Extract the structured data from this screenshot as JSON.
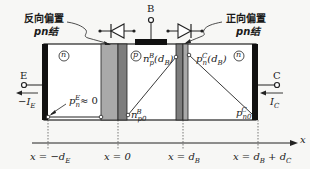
{
  "annotations": {
    "left_junction": {
      "line1": "反向偏置",
      "line2": "pn结"
    },
    "right_junction": {
      "line1": "正向偏置",
      "line2": "pn结"
    }
  },
  "terminals": {
    "base": "B",
    "emitter": "E",
    "collector": "C",
    "emitter_current": "−I",
    "emitter_current_sub": "E",
    "collector_current": "I",
    "collector_current_sub": "C"
  },
  "regions": {
    "emitter": "n",
    "base": "p",
    "collector": "n"
  },
  "carrier_labels": {
    "pE_main": "p",
    "pE_sub": "n",
    "pE_sup": "E",
    "pE_value": "≈ 0",
    "npB_main": "n",
    "npB_sub": "p",
    "npB_sup": "B",
    "npB_arg": "(d",
    "npB_arg_sub": "B",
    "npB_close": ")",
    "pnC_main": "p",
    "pnC_sub": "n",
    "pnC_sup": "C",
    "pnC_arg": "(d",
    "pnC_arg_sub": "B",
    "pnC_close": ")",
    "np0_main": "n",
    "np0_sub": "p0",
    "np0_sup": "B",
    "pn0_main": "p",
    "pn0_sub": "n0",
    "pn0_sup": "C"
  },
  "axis": {
    "label": "x",
    "ticks": [
      {
        "pre": "x = −d",
        "sub": "E",
        "post": ""
      },
      {
        "pre": "x = 0",
        "sub": "",
        "post": ""
      },
      {
        "pre": "x = d",
        "sub": "B",
        "post": ""
      },
      {
        "pre": "x = d",
        "sub": "B",
        "post": " + d",
        "sub2": "C"
      }
    ]
  },
  "colors": {
    "background": "#f7f7f5",
    "contact": "#111111",
    "depletion_light": "#a9a9a9",
    "depletion_dark": "#7d7d7d",
    "line": "#222222"
  }
}
